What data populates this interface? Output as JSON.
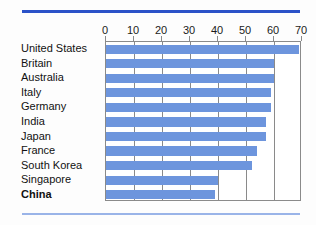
{
  "figure": {
    "title": "",
    "bar_color": "#6d95dd",
    "rule_top_color": "#2b52c8",
    "rule_bottom_color": "#9ab4e8",
    "frame_color": "#8a8a8a"
  },
  "chart_data": {
    "type": "bar",
    "orientation": "horizontal",
    "title": "",
    "xlabel": "",
    "ylabel": "",
    "xlim": [
      0,
      70
    ],
    "ylim": null,
    "grid": true,
    "legend": "none",
    "xticks": [
      0,
      10,
      20,
      30,
      40,
      50,
      60,
      70
    ],
    "xtick_labels": [
      "0",
      "10",
      "20",
      "30",
      "40",
      "50",
      "60",
      "70"
    ],
    "categories": [
      "United States",
      "Britain",
      "Australia",
      "Italy",
      "Germany",
      "India",
      "Japan",
      "France",
      "South Korea",
      "Singapore",
      "China"
    ],
    "emphasized_categories": [
      "China"
    ],
    "values": [
      69,
      60,
      60,
      59,
      59,
      57,
      57,
      54,
      52,
      40,
      39
    ],
    "series": [
      {
        "name": "",
        "values": [
          69,
          60,
          60,
          59,
          59,
          57,
          57,
          54,
          52,
          40,
          39
        ]
      }
    ]
  }
}
